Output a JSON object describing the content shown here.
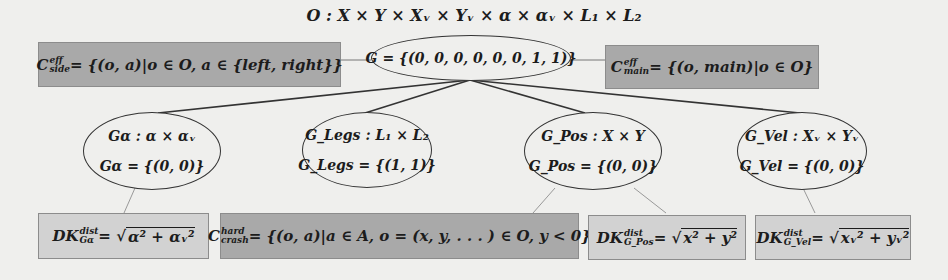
{
  "title": "O : X × Y × Xᵥ × Yᵥ × α × αᵥ × L₁ × L₂",
  "root": {
    "label": "G = {(0, 0, 0, 0, 0, 0, 1, 1)}"
  },
  "side_constraints": {
    "left": {
      "symbol": "C",
      "sup": "eff",
      "sub": "side",
      "rest": " = {(o, a)|o ∈ O, a ∈ {left, right}}",
      "style": "dark"
    },
    "right": {
      "symbol": "C",
      "sup": "eff",
      "sub": "main",
      "rest": " = {(o, main)|o ∈ O}",
      "style": "dark"
    }
  },
  "subgoals": [
    {
      "line1": "Gα : α × αᵥ",
      "line2": "Gα = {(0, 0)}"
    },
    {
      "line1": "G_Legs : L₁ × L₂",
      "line2": "G_Legs = {(1, 1)}"
    },
    {
      "line1": "G_Pos : X × Y",
      "line2": "G_Pos = {(0, 0)}"
    },
    {
      "line1": "G_Vel : Xᵥ × Yᵥ",
      "line2": "G_Vel = {(0, 0)}"
    }
  ],
  "bottom_boxes": [
    {
      "prefix": "DK",
      "sup": "dist",
      "sub": "Gα",
      "rest": " = √",
      "radicand": "α² + αᵥ²",
      "style": "light"
    },
    {
      "prefix": "C",
      "sup": "hard",
      "sub": "crash",
      "rest": " = {(o, a)|a ∈ A, o = (x, y, . . . ) ∈ O, y < 0}",
      "radicand": "",
      "style": "dark"
    },
    {
      "prefix": "DK",
      "sup": "dist",
      "sub": "G_Pos",
      "rest": " = √",
      "radicand": "x² + y²",
      "style": "light"
    },
    {
      "prefix": "DK",
      "sup": "dist",
      "sub": "G_Vel",
      "rest": " = √",
      "radicand": "xᵥ² + yᵥ²",
      "style": "light"
    }
  ],
  "colors": {
    "dark_box": "#a9a9a9",
    "light_box": "#d2d2d2",
    "background": "#efefed"
  }
}
